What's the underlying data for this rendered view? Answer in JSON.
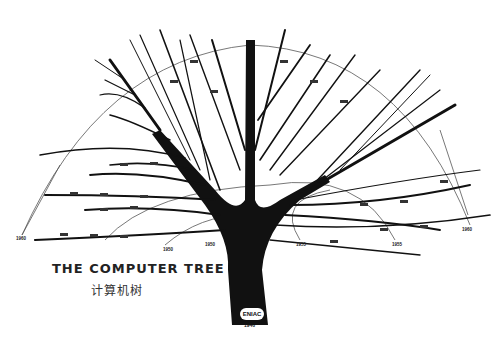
{
  "title": "THE COMPUTER TREE",
  "subtitle": "计算机树",
  "root": {
    "label": "ENIAC",
    "year": "1946"
  },
  "era_rings": [
    {
      "year": "1950",
      "x": 165,
      "y": 247
    },
    {
      "year": "1950",
      "x": 212,
      "y": 237
    },
    {
      "year": "1955",
      "x": 300,
      "y": 240
    },
    {
      "year": "1955",
      "x": 395,
      "y": 241
    },
    {
      "year": "1960",
      "x": 16,
      "y": 235
    },
    {
      "year": "1960",
      "x": 463,
      "y": 225
    }
  ],
  "colors": {
    "ink": "#111111",
    "background": "#ffffff",
    "ring": "#555555"
  }
}
